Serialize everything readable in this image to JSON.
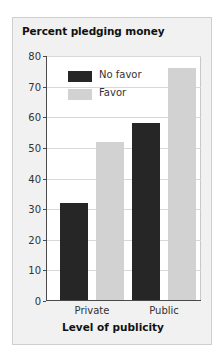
{
  "chart_data": {
    "type": "bar",
    "title": "Percent pledging money",
    "xlabel": "Level of publicity",
    "ylabel": "",
    "categories": [
      "Private",
      "Public"
    ],
    "series": [
      {
        "name": "No favor",
        "values": [
          32,
          58
        ],
        "color": "#262626"
      },
      {
        "name": "Favor",
        "values": [
          52,
          76
        ],
        "color": "#d2d2d2"
      }
    ],
    "ylim": [
      0,
      80
    ],
    "yticks": [
      0,
      10,
      20,
      30,
      40,
      50,
      60,
      70,
      80
    ],
    "ytick_labels": [
      "0",
      "10",
      "20",
      "30",
      "40",
      "50",
      "60",
      "70",
      "80"
    ],
    "grid": true,
    "legend_position": "upper left"
  },
  "figure": {
    "panel_background": "#f1f1f1",
    "plot_background": "#ffffff",
    "border_color": "#cfcfcf",
    "axis_color": "#4a4a4a",
    "grid_color": "#d8d8d8"
  }
}
